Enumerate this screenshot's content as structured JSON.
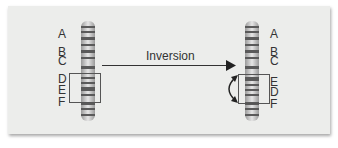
{
  "diagram": {
    "title": "Inversion",
    "arrow_label": "Inversion",
    "left_chromosome": {
      "labels": [
        "A",
        "B",
        "C",
        "D",
        "E",
        "F"
      ],
      "boxed_region": [
        "D",
        "E"
      ]
    },
    "right_chromosome": {
      "labels": [
        "A",
        "B",
        "C",
        "E",
        "D",
        "F"
      ],
      "boxed_region": [
        "E",
        "D"
      ]
    },
    "colors": {
      "background": "#ecedeb",
      "chromosome": "#c8c8c8",
      "band": "#555555",
      "text": "#333333"
    }
  }
}
